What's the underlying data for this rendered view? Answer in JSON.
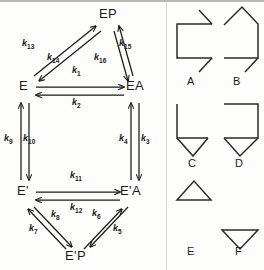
{
  "figure": {
    "type": "kinetic-reaction-scheme",
    "panel_left": {
      "name": "reaction-scheme",
      "nodes": [
        {
          "id": "EP",
          "label": "EP",
          "x": 107,
          "y": 14
        },
        {
          "id": "E",
          "label": "E",
          "x": 21,
          "y": 86
        },
        {
          "id": "EA",
          "label": "EA",
          "x": 128,
          "y": 86
        },
        {
          "id": "Ep",
          "label": "E'",
          "x": 21,
          "y": 191
        },
        {
          "id": "EpA",
          "label": "E'A",
          "x": 124,
          "y": 191
        },
        {
          "id": "EpP",
          "label": "E'P",
          "x": 73,
          "y": 256
        }
      ],
      "rate_constants": [
        {
          "id": "k1",
          "base": "k",
          "sub": "1",
          "from": "E",
          "to": "EA",
          "x": 76,
          "y": 72
        },
        {
          "id": "k2",
          "base": "k",
          "sub": "2",
          "from": "EA",
          "to": "E",
          "x": 76,
          "y": 100
        },
        {
          "id": "k3",
          "base": "k",
          "sub": "3",
          "from": "EA",
          "to": "E'A",
          "x": 142,
          "y": 139
        },
        {
          "id": "k4",
          "base": "k",
          "sub": "4",
          "from": "E'A",
          "to": "EA",
          "x": 124,
          "y": 139
        },
        {
          "id": "k5",
          "base": "k",
          "sub": "5",
          "from": "E'A",
          "to": "E'P",
          "x": 116,
          "y": 228
        },
        {
          "id": "k6",
          "base": "k",
          "sub": "6",
          "from": "E'P",
          "to": "E'A",
          "x": 96,
          "y": 215
        },
        {
          "id": "k7",
          "base": "k",
          "sub": "7",
          "from": "E'P",
          "to": "E'",
          "x": 34,
          "y": 229
        },
        {
          "id": "k8",
          "base": "k",
          "sub": "8",
          "from": "E'",
          "to": "E'P",
          "x": 56,
          "y": 216
        },
        {
          "id": "k9",
          "base": "k",
          "sub": "9",
          "from": "E'",
          "to": "E",
          "x": 9,
          "y": 139
        },
        {
          "id": "k10",
          "base": "k",
          "sub": "10",
          "from": "E",
          "to": "E'",
          "x": 28,
          "y": 139
        },
        {
          "id": "k11",
          "base": "k",
          "sub": "11",
          "from": "E'",
          "to": "E'A",
          "x": 76,
          "y": 177
        },
        {
          "id": "k12",
          "base": "k",
          "sub": "12",
          "from": "E'A",
          "to": "E'",
          "x": 76,
          "y": 205
        },
        {
          "id": "k13",
          "base": "k",
          "sub": "13",
          "from": "E",
          "to": "EP",
          "x": 28,
          "y": 44
        },
        {
          "id": "k14",
          "base": "k",
          "sub": "14",
          "from": "EP",
          "to": "E",
          "x": 52,
          "y": 57
        },
        {
          "id": "k15",
          "base": "k",
          "sub": "15",
          "from": "EA",
          "to": "EP",
          "x": 122,
          "y": 44
        },
        {
          "id": "k16",
          "base": "k",
          "sub": "16",
          "from": "EP",
          "to": "EA",
          "x": 99,
          "y": 57
        }
      ]
    },
    "panel_right": {
      "name": "shape-legend",
      "shapes": [
        {
          "id": "A",
          "label": "A",
          "description": "open-bracket-with-two-arrowheads"
        },
        {
          "id": "B",
          "label": "B",
          "description": "peaked-pentagon-with-arrowhead"
        },
        {
          "id": "C",
          "label": "C",
          "description": "L-shape-with-down-arrowhead"
        },
        {
          "id": "D",
          "label": "D",
          "description": "box-with-down-arrowhead"
        },
        {
          "id": "E",
          "label": "E",
          "description": "up-triangle"
        },
        {
          "id": "F",
          "label": "F",
          "description": "down-triangle"
        }
      ]
    },
    "colors": {
      "ink": "#1a1a1a",
      "background": "#fdfdfb",
      "rule": "#b9b9b4"
    }
  }
}
